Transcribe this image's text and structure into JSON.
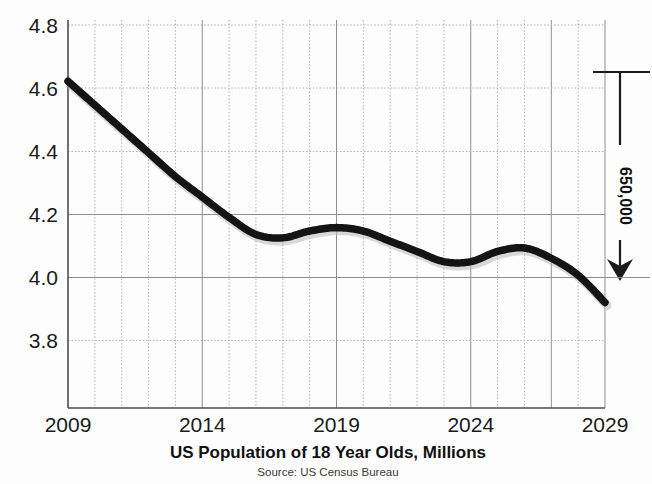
{
  "chart_data": {
    "type": "line",
    "title": "US Population of 18 Year Olds, Millions",
    "source": "Source: US Census Bureau",
    "xlabel": "",
    "ylabel": "",
    "xlim": [
      2009,
      2029
    ],
    "ylim": [
      3.7,
      4.84
    ],
    "grid": true,
    "legend": null,
    "ytick_labels": [
      "4.8",
      "4.6",
      "4.4",
      "4.2",
      "4.0",
      "3.8"
    ],
    "ytick_values": [
      4.8,
      4.6,
      4.4,
      4.2,
      4.0,
      3.8
    ],
    "xtick_labels": [
      "2009",
      "2014",
      "2019",
      "2024",
      "2029"
    ],
    "xtick_values": [
      2009,
      2014,
      2019,
      2024,
      2029
    ],
    "x": [
      2009,
      2010,
      2011,
      2012,
      2013,
      2014,
      2015,
      2016,
      2017,
      2018,
      2019,
      2020,
      2021,
      2022,
      2023,
      2024,
      2025,
      2026,
      2027,
      2028,
      2029
    ],
    "values": [
      4.66,
      4.59,
      4.52,
      4.45,
      4.38,
      4.32,
      4.26,
      4.21,
      4.2,
      4.22,
      4.23,
      4.22,
      4.19,
      4.16,
      4.13,
      4.13,
      4.16,
      4.17,
      4.14,
      4.09,
      4.01
    ],
    "series": [
      {
        "name": "US Population of 18 Year Olds",
        "values": [
          4.66,
          4.59,
          4.52,
          4.45,
          4.38,
          4.32,
          4.26,
          4.21,
          4.2,
          4.22,
          4.23,
          4.22,
          4.19,
          4.16,
          4.13,
          4.13,
          4.16,
          4.17,
          4.14,
          4.09,
          4.01
        ],
        "color": "#141414"
      }
    ],
    "annotations": [
      {
        "name": "decline-bracket",
        "label": "650,000",
        "orientation": "vertical",
        "from_value": 4.66,
        "to_value": 4.01,
        "arrow": "down"
      }
    ]
  },
  "colors": {
    "line": "#141414",
    "axis": "#555555",
    "grid_major": "#9a9a9a",
    "grid_minor": "#b5b5b5",
    "text": "#1a1a1a",
    "background": "#fdfdfd"
  }
}
